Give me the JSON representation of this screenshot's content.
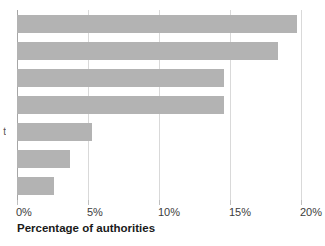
{
  "chart_data": {
    "type": "bar",
    "orientation": "horizontal",
    "title": "",
    "subtitle": "",
    "xlabel": "Percentage of authorities",
    "ylabel": "",
    "categories": [
      "",
      "",
      "",
      "",
      "",
      "",
      ""
    ],
    "values": [
      19.7,
      18.4,
      14.6,
      14.6,
      5.3,
      3.7,
      2.6
    ],
    "xlim": [
      0,
      20
    ],
    "ylim": null,
    "x_ticks": [
      0,
      5,
      10,
      15,
      20
    ],
    "x_tick_labels": [
      "0%",
      "5%",
      "10%",
      "15%",
      "20%"
    ],
    "grid": "vertical",
    "legend": null,
    "bar_color": "#b3b3b3",
    "gridline_color": "#d9d9d9",
    "axis_color": "#a6a6a6",
    "annotations": []
  },
  "axis": {
    "x_title": "Percentage of authorities",
    "ticks": [
      {
        "value": 0,
        "label": "0%"
      },
      {
        "value": 5,
        "label": "5%"
      },
      {
        "value": 10,
        "label": "10%"
      },
      {
        "value": 15,
        "label": "15%"
      },
      {
        "value": 20,
        "label": "20%"
      }
    ]
  },
  "bars": [
    {
      "value": 19.7,
      "label": ""
    },
    {
      "value": 18.4,
      "label": ""
    },
    {
      "value": 14.6,
      "label": ""
    },
    {
      "value": 14.6,
      "label": ""
    },
    {
      "value": 5.3,
      "label": ""
    },
    {
      "value": 3.7,
      "label": ""
    },
    {
      "value": 2.6,
      "label": ""
    }
  ],
  "cropped_category_text": "t"
}
